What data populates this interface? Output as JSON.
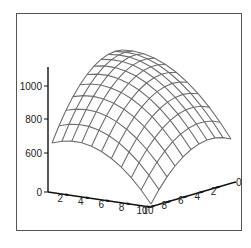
{
  "chart_data": {
    "type": "surface",
    "title": "",
    "xlabel": "",
    "ylabel": "",
    "zlabel": "",
    "x": [
      0,
      1,
      2,
      3,
      4,
      5,
      6,
      7,
      8,
      9,
      10
    ],
    "y": [
      0,
      1,
      2,
      3,
      4,
      5,
      6,
      7,
      8,
      9,
      10
    ],
    "z_formula_note": "dome-shaped surface, max near far corner, ~600 at left/right ends",
    "zlim": [
      0,
      1100
    ],
    "x_ticks": [
      "2",
      "4",
      "6",
      "8",
      "10"
    ],
    "y_ticks": [
      "0",
      "2",
      "4",
      "6",
      "8",
      "10"
    ],
    "z_ticks": [
      "0",
      "600",
      "800",
      "1000"
    ],
    "x_origin_label": "0",
    "grid": false,
    "wire_color": "#6e6e6e",
    "axis_color": "#111111"
  }
}
